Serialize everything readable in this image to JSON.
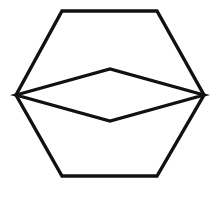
{
  "figure": {
    "background_color": "#ffffff",
    "stroke_color": "#111111",
    "stroke_width": 3.4,
    "canvas": {
      "width": 220,
      "height": 198
    },
    "shapes": [
      {
        "name": "hexagon",
        "kind": "polygon",
        "closed": true,
        "vertex_count": 6,
        "points": "16,95 62,11 157,11 204,95 157,176 62,176",
        "vertices": [
          {
            "label": "left",
            "x": 16,
            "y": 95
          },
          {
            "label": "top-left",
            "x": 62,
            "y": 11
          },
          {
            "label": "top-right",
            "x": 157,
            "y": 11
          },
          {
            "label": "right",
            "x": 204,
            "y": 95
          },
          {
            "label": "bottom-right",
            "x": 157,
            "y": 176
          },
          {
            "label": "bottom-left",
            "x": 62,
            "y": 176
          }
        ]
      },
      {
        "name": "rhombus",
        "kind": "polygon",
        "closed": true,
        "vertex_count": 4,
        "points": "16,95 110,69 204,95 110,121",
        "vertices": [
          {
            "label": "left",
            "x": 16,
            "y": 95
          },
          {
            "label": "top",
            "x": 110,
            "y": 69
          },
          {
            "label": "right",
            "x": 204,
            "y": 95
          },
          {
            "label": "bottom",
            "x": 110,
            "y": 121
          }
        ]
      }
    ]
  }
}
